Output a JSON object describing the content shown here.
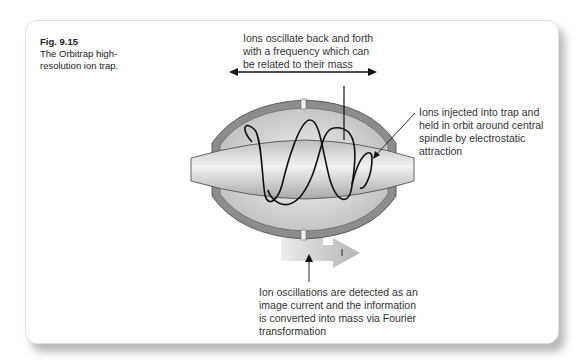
{
  "figure": {
    "number": "Fig. 9.15",
    "caption": "The Orbitrap high-resolution ion trap."
  },
  "annotations": {
    "top": "Ions oscillate back and forth with a frequency which can be related to their mass",
    "right": "Ions injected into trap and held in orbit around central spindle by electrostatic attraction",
    "bottom": "Ion oscillations are detected as an image current and the information is converted into mass via Fourier transformation"
  },
  "diagram": {
    "components": [
      "outer-barrel-electrode",
      "central-spindle-electrode",
      "ion-orbit-trajectory",
      "image-current-signal-arrow",
      "axial-oscillation-arrow"
    ],
    "colors": {
      "outer_electrode": "#8a8a8a",
      "inner_cavity": "#d9d9d9",
      "spindle": "#cfcfcf",
      "trajectory": "#111111",
      "signal_arrow": "#bdbdbd"
    }
  }
}
